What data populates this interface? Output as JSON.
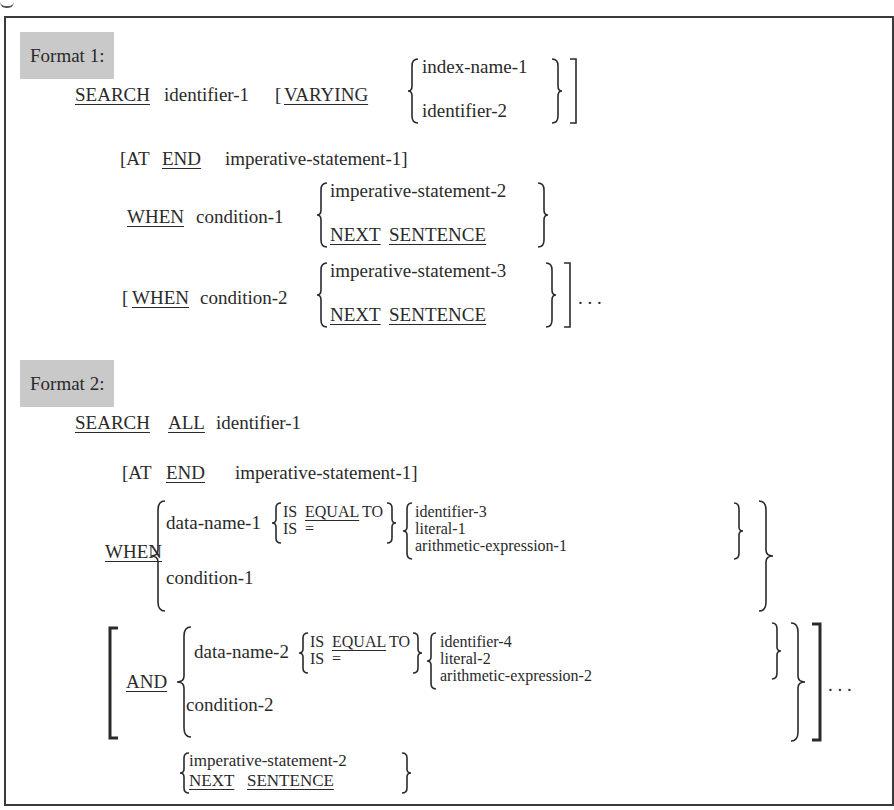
{
  "format1": {
    "label": "Format 1:",
    "line1": {
      "kw_search": "SEARCH",
      "id1": "identifier-1",
      "open": "[",
      "kw_varying": "VARYING",
      "opt_a": "index-name-1",
      "opt_b": "identifier-2"
    },
    "line2": {
      "open": "[AT",
      "kw_end": "END",
      "rest": "imperative-statement-1]"
    },
    "line3": {
      "kw_when": "WHEN",
      "cond": "condition-1",
      "opt_a": "imperative-statement-2",
      "kw_next": "NEXT",
      "kw_sentence": "SENTENCE"
    },
    "line4": {
      "open": "[",
      "kw_when": "WHEN",
      "cond": "condition-2",
      "opt_a": "imperative-statement-3",
      "kw_next": "NEXT",
      "kw_sentence": "SENTENCE",
      "ellipsis": ". . ."
    }
  },
  "format2": {
    "label": "Format 2:",
    "line1": {
      "kw_search": "SEARCH",
      "kw_all": "ALL",
      "id1": "identifier-1"
    },
    "line2": {
      "open": "[AT",
      "kw_end": "END",
      "rest": "imperative-statement-1]"
    },
    "when": {
      "kw_when": "WHEN",
      "dname": "data-name-1",
      "is1": "IS",
      "kw_equal": "EQUAL",
      "to": "TO",
      "is2": "IS",
      "eq": "=",
      "opt_a": "identifier-3",
      "opt_b": "literal-1",
      "opt_c": "arithmetic-expression-1",
      "cond": "condition-1"
    },
    "and": {
      "kw_and": "AND",
      "dname": "data-name-2",
      "is1": "IS",
      "kw_equal": "EQUAL",
      "to": "TO",
      "is2": "IS",
      "eq": "=",
      "opt_a": "identifier-4",
      "opt_b": "literal-2",
      "opt_c": "arithmetic-expression-2",
      "cond": "condition-2",
      "ellipsis": ". . ."
    },
    "final": {
      "opt_a": "imperative-statement-2",
      "kw_next": "NEXT",
      "kw_sentence": "SENTENCE"
    }
  }
}
